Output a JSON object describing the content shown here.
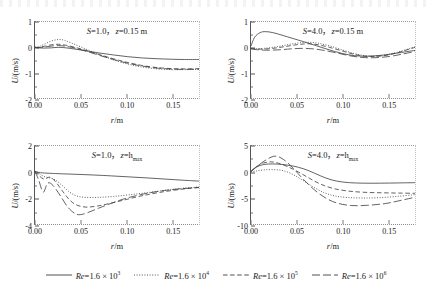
{
  "figure": {
    "xlabel_var": "r",
    "xlabel_unit": "/m",
    "ylabel_var": "U",
    "ylabel_unit": "/(m/s)"
  },
  "legend": {
    "items": [
      {
        "name": "Re",
        "eq": "=1.6 × 10",
        "exp": "3",
        "style": "solid",
        "data_name": "legend-re-1e3"
      },
      {
        "name": "Re",
        "eq": "=1.6 × 10",
        "exp": "4",
        "style": "dotted",
        "data_name": "legend-re-1e4"
      },
      {
        "name": "Re",
        "eq": "=1.6 × 10",
        "exp": "5",
        "style": "dashed",
        "data_name": "legend-re-1e5"
      },
      {
        "name": "Re",
        "eq": "=1.6 × 10",
        "exp": "6",
        "style": "longdash",
        "data_name": "legend-re-1e6"
      }
    ]
  },
  "chart_data": [
    {
      "id": "top-left",
      "type": "line",
      "title_S": "S",
      "title_S_val": "=1.0，",
      "title_z": "z",
      "title_z_val": "=0.15 m",
      "title_sub": "",
      "xlabel": "r/m",
      "ylabel": "U/(m/s)",
      "xlim": [
        0.0,
        0.18
      ],
      "ylim": [
        -2,
        1
      ],
      "xticks": [
        "0.00",
        "0.05",
        "0.10",
        "0.15"
      ],
      "xtickvals": [
        0.0,
        0.05,
        0.1,
        0.15
      ],
      "yticks": [
        "1",
        "0",
        "-1",
        "-2"
      ],
      "ytickvals": [
        1,
        0,
        -1,
        -2
      ],
      "series": [
        {
          "name": "Re=1.6×10^3",
          "style": "solid",
          "x": [
            0.0,
            0.004,
            0.01,
            0.018,
            0.026,
            0.034,
            0.044,
            0.056,
            0.07,
            0.086,
            0.102,
            0.118,
            0.134,
            0.15,
            0.164,
            0.18
          ],
          "y": [
            0.0,
            -0.02,
            -0.03,
            -0.02,
            0.0,
            -0.02,
            -0.07,
            -0.14,
            -0.22,
            -0.3,
            -0.37,
            -0.42,
            -0.45,
            -0.47,
            -0.48,
            -0.48
          ]
        },
        {
          "name": "Re=1.6×10^4",
          "style": "dotted",
          "x": [
            0.0,
            0.004,
            0.01,
            0.018,
            0.026,
            0.032,
            0.04,
            0.05,
            0.062,
            0.076,
            0.09,
            0.104,
            0.118,
            0.134,
            0.15,
            0.166,
            0.18
          ],
          "y": [
            0.0,
            0.02,
            0.12,
            0.25,
            0.31,
            0.28,
            0.17,
            0.02,
            -0.16,
            -0.36,
            -0.54,
            -0.68,
            -0.78,
            -0.85,
            -0.88,
            -0.88,
            -0.87
          ]
        },
        {
          "name": "Re=1.6×10^5",
          "style": "dashed",
          "x": [
            0.0,
            0.004,
            0.01,
            0.018,
            0.026,
            0.034,
            0.044,
            0.056,
            0.07,
            0.086,
            0.102,
            0.118,
            0.134,
            0.15,
            0.166,
            0.18
          ],
          "y": [
            0.0,
            0.0,
            0.04,
            0.1,
            0.12,
            0.08,
            0.0,
            -0.12,
            -0.28,
            -0.45,
            -0.6,
            -0.72,
            -0.8,
            -0.84,
            -0.85,
            -0.84
          ]
        },
        {
          "name": "Re=1.6×10^6",
          "style": "longdash",
          "x": [
            0.0,
            0.004,
            0.01,
            0.018,
            0.026,
            0.034,
            0.044,
            0.056,
            0.07,
            0.086,
            0.102,
            0.118,
            0.134,
            0.15,
            0.166,
            0.18
          ],
          "y": [
            0.0,
            -0.01,
            0.01,
            0.05,
            0.07,
            0.04,
            -0.03,
            -0.15,
            -0.31,
            -0.48,
            -0.63,
            -0.74,
            -0.82,
            -0.86,
            -0.87,
            -0.86
          ]
        }
      ]
    },
    {
      "id": "top-right",
      "type": "line",
      "title_S": "S",
      "title_S_val": "=4.0，",
      "title_z": "z",
      "title_z_val": "=0.15 m",
      "title_sub": "",
      "xlabel": "r/m",
      "ylabel": "U/(m/s)",
      "xlim": [
        0.0,
        0.18
      ],
      "ylim": [
        -2,
        1
      ],
      "xticks": [
        "0.00",
        "0.05",
        "0.10",
        "0.15"
      ],
      "xtickvals": [
        0.0,
        0.05,
        0.1,
        0.15
      ],
      "yticks": [
        "1",
        "0",
        "-1",
        "-2"
      ],
      "ytickvals": [
        1,
        0,
        -1,
        -2
      ],
      "series": [
        {
          "name": "Re=1.6×10^3",
          "style": "solid",
          "x": [
            0.0,
            0.004,
            0.01,
            0.016,
            0.024,
            0.034,
            0.046,
            0.058,
            0.072,
            0.086,
            0.1,
            0.114,
            0.128,
            0.144,
            0.16,
            0.18
          ],
          "y": [
            0.05,
            0.4,
            0.58,
            0.62,
            0.58,
            0.48,
            0.35,
            0.22,
            0.06,
            -0.1,
            -0.24,
            -0.33,
            -0.35,
            -0.31,
            -0.23,
            -0.12
          ]
        },
        {
          "name": "Re=1.6×10^4",
          "style": "dotted",
          "x": [
            0.0,
            0.006,
            0.014,
            0.024,
            0.034,
            0.044,
            0.054,
            0.064,
            0.074,
            0.086,
            0.1,
            0.114,
            0.128,
            0.144,
            0.16,
            0.18
          ],
          "y": [
            -0.04,
            -0.05,
            -0.04,
            0.0,
            0.06,
            0.13,
            0.18,
            0.2,
            0.16,
            0.06,
            -0.1,
            -0.25,
            -0.34,
            -0.32,
            -0.2,
            0.02
          ]
        },
        {
          "name": "Re=1.6×10^5",
          "style": "dashed",
          "x": [
            0.0,
            0.006,
            0.014,
            0.024,
            0.034,
            0.044,
            0.054,
            0.064,
            0.074,
            0.086,
            0.1,
            0.114,
            0.128,
            0.144,
            0.16,
            0.18
          ],
          "y": [
            -0.05,
            -0.07,
            -0.07,
            -0.04,
            0.01,
            0.07,
            0.12,
            0.14,
            0.1,
            0.0,
            -0.14,
            -0.28,
            -0.36,
            -0.34,
            -0.22,
            0.0
          ]
        },
        {
          "name": "Re=1.6×10^6",
          "style": "longdash",
          "x": [
            0.0,
            0.006,
            0.014,
            0.024,
            0.034,
            0.044,
            0.056,
            0.068,
            0.08,
            0.094,
            0.108,
            0.122,
            0.136,
            0.152,
            0.166,
            0.18
          ],
          "y": [
            -0.06,
            -0.09,
            -0.11,
            -0.11,
            -0.09,
            -0.06,
            -0.04,
            -0.06,
            -0.12,
            -0.22,
            -0.33,
            -0.4,
            -0.41,
            -0.36,
            -0.27,
            -0.16
          ]
        }
      ]
    },
    {
      "id": "bottom-left",
      "type": "line",
      "title_S": "S",
      "title_S_val": "=1.0，",
      "title_z": "z",
      "title_z_val": "=h",
      "title_sub": "max",
      "xlabel": "r/m",
      "ylabel": "U/(m/s)",
      "xlim": [
        0.0,
        0.18
      ],
      "ylim": [
        -4,
        2
      ],
      "xticks": [
        "0.00",
        "0.05",
        "0.10",
        "0.15"
      ],
      "xtickvals": [
        0.0,
        0.05,
        0.1,
        0.15
      ],
      "yticks": [
        "2",
        "0",
        "-2",
        "-4"
      ],
      "ytickvals": [
        2,
        0,
        -2,
        -4
      ],
      "series": [
        {
          "name": "Re=1.6×10^3",
          "style": "solid",
          "x": [
            0.0,
            0.006,
            0.016,
            0.03,
            0.046,
            0.064,
            0.084,
            0.104,
            0.124,
            0.144,
            0.162,
            0.18
          ],
          "y": [
            0.05,
            -0.05,
            -0.1,
            -0.14,
            -0.18,
            -0.23,
            -0.3,
            -0.38,
            -0.46,
            -0.55,
            -0.63,
            -0.7
          ]
        },
        {
          "name": "Re=1.6×10^4",
          "style": "dotted",
          "x": [
            0.0,
            0.004,
            0.01,
            0.016,
            0.022,
            0.03,
            0.038,
            0.046,
            0.056,
            0.07,
            0.086,
            0.104,
            0.124,
            0.144,
            0.162,
            0.18
          ],
          "y": [
            0.05,
            -0.1,
            -0.35,
            -0.45,
            -0.6,
            -1.05,
            -1.55,
            -1.85,
            -1.95,
            -1.95,
            -1.88,
            -1.75,
            -1.58,
            -1.4,
            -1.25,
            -1.15
          ]
        },
        {
          "name": "Re=1.6×10^5",
          "style": "dashed",
          "x": [
            0.0,
            0.004,
            0.01,
            0.016,
            0.022,
            0.03,
            0.038,
            0.046,
            0.056,
            0.068,
            0.082,
            0.098,
            0.116,
            0.136,
            0.158,
            0.18
          ],
          "y": [
            0.05,
            -0.25,
            -0.55,
            -0.4,
            -0.7,
            -1.45,
            -2.15,
            -2.55,
            -2.7,
            -2.62,
            -2.42,
            -2.15,
            -1.85,
            -1.58,
            -1.35,
            -1.18
          ]
        },
        {
          "name": "Re=1.6×10^6",
          "style": "longdash",
          "x": [
            0.0,
            0.004,
            0.009,
            0.014,
            0.02,
            0.028,
            0.036,
            0.044,
            0.05,
            0.058,
            0.07,
            0.084,
            0.1,
            0.12,
            0.142,
            0.162,
            0.18
          ],
          "y": [
            0.05,
            -0.6,
            -1.55,
            -0.85,
            -1.05,
            -1.85,
            -2.7,
            -3.2,
            -3.28,
            -3.12,
            -2.78,
            -2.4,
            -2.02,
            -1.68,
            -1.42,
            -1.28,
            -1.2
          ]
        }
      ]
    },
    {
      "id": "bottom-right",
      "type": "line",
      "title_S": "S",
      "title_S_val": "=4.0，",
      "title_z": "z",
      "title_z_val": "=h",
      "title_sub": "max",
      "xlabel": "r/m",
      "ylabel": "U/(m/s)",
      "xlim": [
        0.0,
        0.18
      ],
      "ylim": [
        -10,
        5
      ],
      "xticks": [
        "0.00",
        "0.05",
        "0.10",
        "0.15"
      ],
      "xtickvals": [
        0.0,
        0.05,
        0.1,
        0.15
      ],
      "yticks": [
        "5",
        "0",
        "-5",
        "-10"
      ],
      "ytickvals": [
        5,
        0,
        -5,
        -10
      ],
      "series": [
        {
          "name": "Re=1.6×10^3",
          "style": "solid",
          "x": [
            0.0,
            0.006,
            0.014,
            0.024,
            0.034,
            0.046,
            0.058,
            0.07,
            0.082,
            0.094,
            0.108,
            0.124,
            0.142,
            0.162,
            0.18
          ],
          "y": [
            0.1,
            0.95,
            1.45,
            1.55,
            1.45,
            1.15,
            0.6,
            -0.25,
            -1.15,
            -1.75,
            -2.05,
            -2.15,
            -2.15,
            -2.1,
            -2.05
          ]
        },
        {
          "name": "Re=1.6×10^4",
          "style": "dotted",
          "x": [
            0.0,
            0.006,
            0.014,
            0.024,
            0.034,
            0.044,
            0.056,
            0.068,
            0.08,
            0.092,
            0.106,
            0.122,
            0.14,
            0.16,
            0.18
          ],
          "y": [
            0.0,
            0.2,
            0.4,
            0.45,
            0.3,
            -0.3,
            -1.5,
            -2.85,
            -3.95,
            -4.6,
            -4.9,
            -5.0,
            -4.95,
            -4.7,
            -4.35
          ]
        },
        {
          "name": "Re=1.6×10^5",
          "style": "dashed",
          "x": [
            0.0,
            0.006,
            0.014,
            0.022,
            0.03,
            0.04,
            0.052,
            0.064,
            0.076,
            0.09,
            0.106,
            0.124,
            0.144,
            0.162,
            0.18
          ],
          "y": [
            0.1,
            1.05,
            1.75,
            1.95,
            1.7,
            1.05,
            0.0,
            -1.2,
            -2.3,
            -3.15,
            -3.65,
            -3.9,
            -4.0,
            -4.05,
            -4.1
          ]
        },
        {
          "name": "Re=1.6×10^6",
          "style": "longdash",
          "x": [
            0.0,
            0.006,
            0.014,
            0.022,
            0.028,
            0.034,
            0.04,
            0.048,
            0.058,
            0.07,
            0.082,
            0.094,
            0.11,
            0.128,
            0.148,
            0.166,
            0.18
          ],
          "y": [
            0.1,
            1.0,
            2.05,
            2.85,
            3.05,
            2.6,
            1.8,
            0.4,
            -1.5,
            -3.5,
            -5.0,
            -5.95,
            -6.45,
            -6.4,
            -6.05,
            -5.4,
            -4.85
          ]
        }
      ]
    }
  ]
}
